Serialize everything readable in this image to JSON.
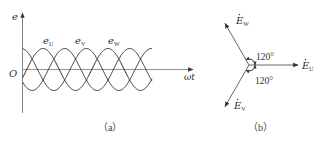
{
  "figure_a": {
    "caption": "（a）",
    "y_axis_label": "e",
    "x_axis_label": "ωt",
    "origin_label": "O",
    "waves": [
      {
        "name": "e",
        "sub": "U",
        "phase_deg": 0
      },
      {
        "name": "e",
        "sub": "V",
        "phase_deg": -120
      },
      {
        "name": "e",
        "sub": "W",
        "phase_deg": 120
      }
    ],
    "colors": {
      "axis": "#888888",
      "wave": "#333333"
    }
  },
  "figure_b": {
    "caption": "（b）",
    "phasors": [
      {
        "name": "E",
        "sub": "U",
        "angle_deg": 0
      },
      {
        "name": "E",
        "sub": "W",
        "angle_deg": 120
      },
      {
        "name": "E",
        "sub": "V",
        "angle_deg": 240
      }
    ],
    "angle_labels": [
      "120°",
      "120°"
    ],
    "colors": {
      "line": "#555555"
    }
  }
}
